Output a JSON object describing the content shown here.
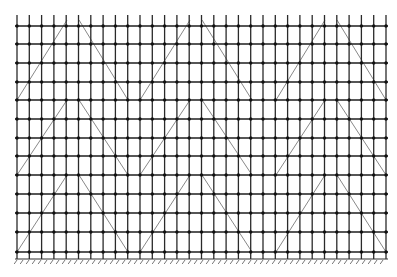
{
  "diagram": {
    "type": "scaffold-elevation-grid",
    "background": "#ffffff",
    "colors": {
      "post": "#2a2a2a",
      "ledger": "#1e1e1e",
      "brace": "#7a7a7a",
      "node": "#111111",
      "ground": "#333333"
    },
    "posts": {
      "count": 31,
      "x_start": 17,
      "x_end": 386,
      "y_top": 15,
      "y_bottom": 259
    },
    "ledgers": {
      "y": [
        26,
        44,
        63,
        82,
        100,
        119,
        138,
        156,
        175,
        194,
        213,
        232,
        252
      ]
    },
    "bracing": {
      "bands": [
        {
          "y_top": 20,
          "y_bottom": 100
        },
        {
          "y_top": 100,
          "y_bottom": 175
        },
        {
          "y_top": 175,
          "y_bottom": 252
        }
      ],
      "segments": [
        {
          "dir": "up",
          "x_bottom": 17,
          "x_top": 67
        },
        {
          "dir": "down",
          "x_top": 79,
          "x_bottom": 128
        },
        {
          "dir": "up",
          "x_bottom": 140,
          "x_top": 190
        },
        {
          "dir": "down",
          "x_top": 202,
          "x_bottom": 252
        },
        {
          "dir": "up",
          "x_bottom": 276,
          "x_top": 325
        },
        {
          "dir": "down",
          "x_top": 337,
          "x_bottom": 386
        }
      ]
    },
    "ground": {
      "y": 259,
      "x_start": 15,
      "x_end": 388,
      "hatch_spacing": 6,
      "hatch_length": 4
    }
  }
}
